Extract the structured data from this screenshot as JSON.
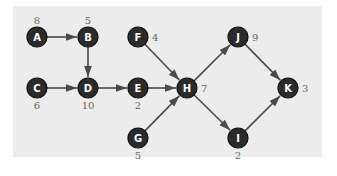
{
  "diagram": {
    "type": "activity-network",
    "background": "#ececec",
    "node_color": "#2b2b2b",
    "edge_color": "#4a4a4a",
    "nodes": [
      {
        "id": "A",
        "label": "A",
        "duration": "8",
        "x": 37,
        "y": 37,
        "dur_pos": "top"
      },
      {
        "id": "B",
        "label": "B",
        "duration": "5",
        "x": 88,
        "y": 37,
        "dur_pos": "top"
      },
      {
        "id": "C",
        "label": "C",
        "duration": "6",
        "x": 37,
        "y": 88,
        "dur_pos": "bottom"
      },
      {
        "id": "D",
        "label": "D",
        "duration": "10",
        "x": 88,
        "y": 88,
        "dur_pos": "bottom"
      },
      {
        "id": "E",
        "label": "E",
        "duration": "2",
        "x": 138,
        "y": 88,
        "dur_pos": "bottom"
      },
      {
        "id": "F",
        "label": "F",
        "duration": "4",
        "x": 138,
        "y": 37,
        "dur_pos": "right"
      },
      {
        "id": "G",
        "label": "G",
        "duration": "5",
        "x": 138,
        "y": 138,
        "dur_pos": "bottom"
      },
      {
        "id": "H",
        "label": "H",
        "duration": "7",
        "x": 187,
        "y": 88,
        "dur_pos": "right"
      },
      {
        "id": "J",
        "label": "J",
        "duration": "9",
        "x": 238,
        "y": 37,
        "dur_pos": "right"
      },
      {
        "id": "I",
        "label": "I",
        "duration": "2",
        "x": 238,
        "y": 138,
        "dur_pos": "bottom"
      },
      {
        "id": "K",
        "label": "K",
        "duration": "3",
        "x": 288,
        "y": 88,
        "dur_pos": "right"
      }
    ],
    "edges": [
      {
        "from": "A",
        "to": "B"
      },
      {
        "from": "B",
        "to": "D"
      },
      {
        "from": "C",
        "to": "D"
      },
      {
        "from": "D",
        "to": "E"
      },
      {
        "from": "E",
        "to": "H"
      },
      {
        "from": "F",
        "to": "H"
      },
      {
        "from": "G",
        "to": "H"
      },
      {
        "from": "H",
        "to": "J"
      },
      {
        "from": "H",
        "to": "I"
      },
      {
        "from": "J",
        "to": "K"
      },
      {
        "from": "I",
        "to": "K"
      }
    ]
  }
}
